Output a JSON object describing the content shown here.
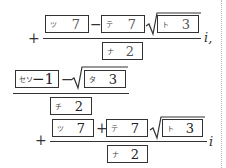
{
  "expression_1": {
    "leading_sign": "+",
    "numerator": {
      "term1": {
        "label": "ツ",
        "value": "7"
      },
      "operator": "−",
      "term2": {
        "label": "テ",
        "value": "7"
      },
      "sqrt_term": {
        "label": "ト",
        "value": "3"
      }
    },
    "denominator": {
      "label": "ナ",
      "value": "2"
    },
    "suffix": "i,"
  },
  "expression_2": {
    "numerator": {
      "term1": {
        "label": "セソ",
        "value": "−1"
      },
      "operator": "−",
      "sqrt_term": {
        "label": "タ",
        "value": "3"
      }
    },
    "denominator": {
      "label": "チ",
      "value": "2"
    }
  },
  "expression_3": {
    "leading_sign": "+",
    "numerator": {
      "term1": {
        "label": "ツ",
        "value": "7"
      },
      "operator": "+",
      "term2": {
        "label": "テ",
        "value": "7"
      },
      "sqrt_term": {
        "label": "ト",
        "value": "3"
      }
    },
    "denominator": {
      "label": "ナ",
      "value": "2"
    },
    "suffix": "i"
  }
}
